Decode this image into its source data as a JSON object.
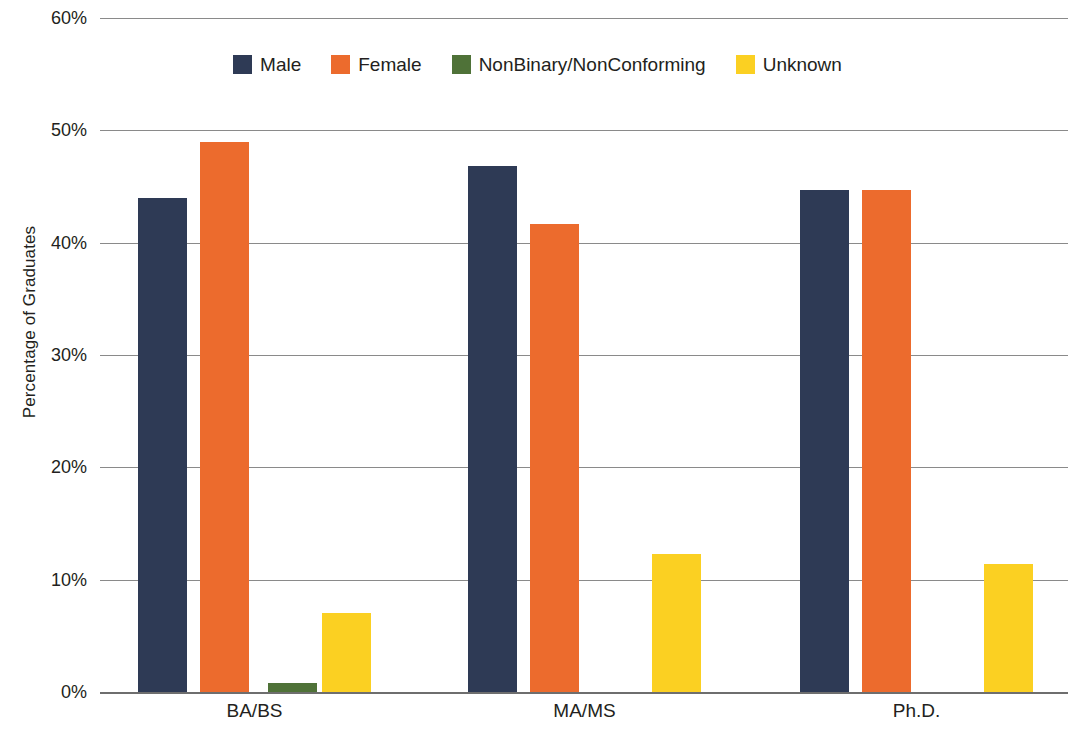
{
  "chart_data": {
    "type": "bar",
    "title": "",
    "xlabel": "",
    "ylabel": "Percentage of Graduates",
    "categories": [
      "BA/BS",
      "MA/MS",
      "Ph.D."
    ],
    "series": [
      {
        "name": "Male",
        "color": "#2e3a55",
        "values": [
          44.0,
          46.8,
          44.7
        ]
      },
      {
        "name": "Female",
        "color": "#ec6b2d",
        "values": [
          49.0,
          41.7,
          44.7
        ]
      },
      {
        "name": "NonBinary/NonConforming",
        "color": "#4f7238",
        "values": [
          0.8,
          0.0,
          0.0
        ]
      },
      {
        "name": "Unknown",
        "color": "#fbd022",
        "values": [
          7.0,
          12.3,
          11.4
        ]
      }
    ],
    "ylim": [
      0,
      60
    ],
    "y_ticks": [
      "0%",
      "10%",
      "20%",
      "30%",
      "40%",
      "50%",
      "60%"
    ],
    "y_tick_values": [
      0,
      10,
      20,
      30,
      40,
      50,
      60
    ],
    "grid": "horizontal",
    "legend_position": "top-center"
  },
  "legend": {
    "items": [
      {
        "label": "Male",
        "color": "#2e3a55"
      },
      {
        "label": "Female",
        "color": "#ec6b2d"
      },
      {
        "label": "NonBinary/NonConforming",
        "color": "#4f7238"
      },
      {
        "label": "Unknown",
        "color": "#fbd022"
      }
    ]
  },
  "axes": {
    "y_title": "Percentage of Graduates",
    "y_ticks": [
      "0%",
      "10%",
      "20%",
      "30%",
      "40%",
      "50%",
      "60%"
    ],
    "x_categories": [
      "BA/BS",
      "MA/MS",
      "Ph.D."
    ]
  }
}
